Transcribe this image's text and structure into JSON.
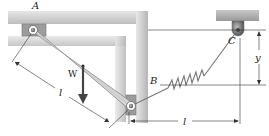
{
  "diagram": {
    "type": "statics-mechanism",
    "labels": {
      "point_a": "A",
      "point_b": "B",
      "point_c": "C",
      "weight": "W",
      "length_bar": "l",
      "length_horizontal": "l",
      "height": "y"
    },
    "components": {
      "bar": "uniform bar AB",
      "pin_a": "pin at A in top track",
      "slider_b": "collar/roller at B in vertical guide",
      "spring": "spring from B to fixed support C",
      "support_c": "fixed pin support C"
    },
    "colors": {
      "frame": "#c9c9c9",
      "frame_shadow": "#9e9e9e",
      "bar": "#d6d6d6",
      "bar_edge": "#7a7a7a",
      "line": "#333333",
      "support": "#a8a8a8",
      "pin_dark": "#555555"
    }
  }
}
